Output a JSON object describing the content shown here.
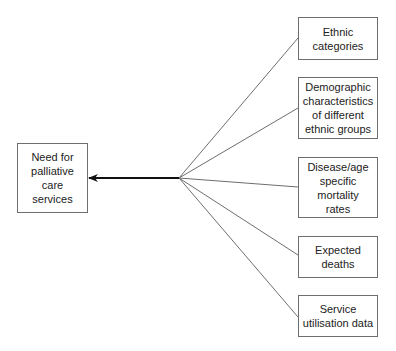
{
  "diagram": {
    "target": {
      "label": "Need for\npalliative\ncare\nservices",
      "box": {
        "x": 17,
        "y": 143,
        "w": 71,
        "h": 70
      }
    },
    "arrow": {
      "from": [
        179,
        178
      ],
      "to": [
        88,
        178
      ],
      "color": "#111111"
    },
    "hub": [
      179,
      178
    ],
    "sources": [
      {
        "label": "Ethnic\ncategories",
        "box": {
          "x": 298,
          "y": 17,
          "w": 80,
          "h": 43
        },
        "connect_y": 38
      },
      {
        "label": "Demographic\ncharacteristics\nof different\nethnic groups",
        "box": {
          "x": 298,
          "y": 77,
          "w": 80,
          "h": 62
        },
        "connect_y": 108
      },
      {
        "label": "Disease/age\nspecific\nmortality\nrates",
        "box": {
          "x": 298,
          "y": 157,
          "w": 80,
          "h": 61
        },
        "connect_y": 187
      },
      {
        "label": "Expected\ndeaths",
        "box": {
          "x": 298,
          "y": 236,
          "w": 80,
          "h": 42
        },
        "connect_y": 255
      },
      {
        "label": "Service\nutilisation data",
        "box": {
          "x": 298,
          "y": 295,
          "w": 80,
          "h": 42
        },
        "connect_y": 317
      }
    ],
    "colors": {
      "border": "#6e6e6e",
      "line": "#6e6e6e",
      "text": "#222222"
    }
  }
}
